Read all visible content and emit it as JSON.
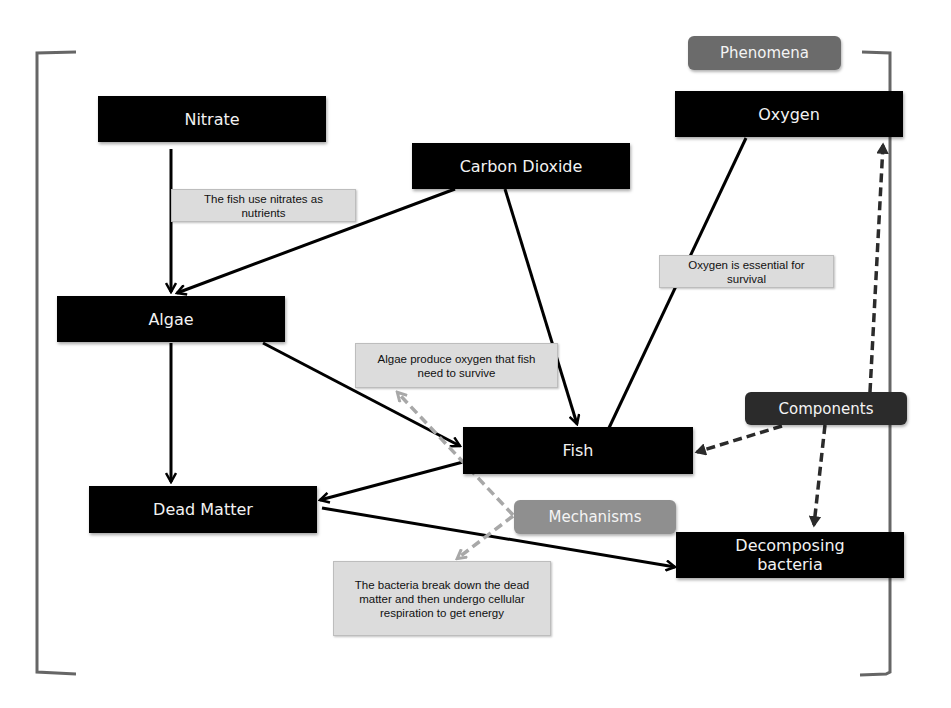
{
  "diagram": {
    "nodes": [
      {
        "id": "nitrate",
        "label": "Nitrate"
      },
      {
        "id": "carbon_dioxide",
        "label": "Carbon Dioxide"
      },
      {
        "id": "oxygen",
        "label": "Oxygen"
      },
      {
        "id": "algae",
        "label": "Algae"
      },
      {
        "id": "fish",
        "label": "Fish"
      },
      {
        "id": "dead_matter",
        "label": "Dead Matter"
      },
      {
        "id": "decomposing_bacteria",
        "label": "Decomposing bacteria"
      }
    ],
    "notes": [
      {
        "id": "nitrate_note",
        "text": "The fish use nitrates as nutrients"
      },
      {
        "id": "oxygen_note",
        "text": "Oxygen is essential for survival"
      },
      {
        "id": "algae_note",
        "text": "Algae produce oxygen that fish need to survive"
      },
      {
        "id": "bacteria_note",
        "text": "The bacteria break down the dead matter and then undergo cellular respiration to get energy"
      }
    ],
    "categories": [
      {
        "id": "phenomena",
        "label": "Phenomena",
        "color": "#6b6b6b"
      },
      {
        "id": "components",
        "label": "Components",
        "color": "#2b2b2b"
      },
      {
        "id": "mechanisms",
        "label": "Mechanisms",
        "color": "#8f8f8f"
      }
    ],
    "edges": [
      {
        "from": "Nitrate",
        "to": "Algae",
        "style": "solid"
      },
      {
        "from": "Carbon Dioxide",
        "to": "Algae",
        "style": "solid"
      },
      {
        "from": "Carbon Dioxide",
        "to": "Fish",
        "style": "solid"
      },
      {
        "from": "Oxygen",
        "to": "Fish",
        "style": "solid"
      },
      {
        "from": "Algae",
        "to": "Fish",
        "style": "solid"
      },
      {
        "from": "Algae",
        "to": "Dead Matter",
        "style": "solid"
      },
      {
        "from": "Fish",
        "to": "Dead Matter",
        "style": "solid"
      },
      {
        "from": "Dead Matter",
        "to": "Decomposing bacteria",
        "style": "solid"
      },
      {
        "from": "Components",
        "to": "Oxygen",
        "style": "dashed"
      },
      {
        "from": "Components",
        "to": "Fish",
        "style": "dashed"
      },
      {
        "from": "Components",
        "to": "Decomposing bacteria",
        "style": "dashed"
      },
      {
        "from": "Mechanisms",
        "to": "Algae produce oxygen note",
        "style": "dashed-gray"
      },
      {
        "from": "Mechanisms",
        "to": "Bacteria note",
        "style": "dashed-gray"
      }
    ],
    "colors": {
      "node_bg": "#000000",
      "node_text": "#f2f2f2",
      "note_bg": "#dcdcdc",
      "bracket": "#666666"
    }
  }
}
